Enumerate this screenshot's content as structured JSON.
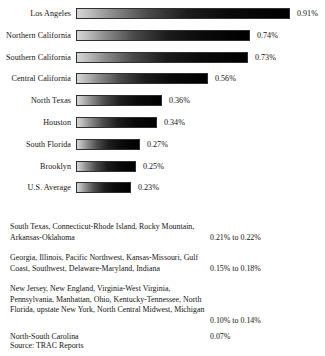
{
  "chart_data": {
    "type": "bar",
    "title": "",
    "xlabel": "",
    "ylabel": "",
    "orientation": "horizontal",
    "grid": false,
    "legend": null,
    "value_suffix": "%",
    "xlim": [
      0,
      0.91
    ],
    "categories": [
      "Los Angeles",
      "Northern California",
      "Southern California",
      "Central California",
      "North Texas",
      "Houston",
      "South Florida",
      "Brooklyn",
      "U.S. Average"
    ],
    "values": [
      0.91,
      0.74,
      0.73,
      0.56,
      0.36,
      0.34,
      0.27,
      0.25,
      0.23
    ],
    "value_labels": [
      "0.91%",
      "0.74%",
      "0.73%",
      "0.56%",
      "0.36%",
      "0.34%",
      "0.27%",
      "0.25%",
      "0.23%"
    ]
  },
  "bars": [
    {
      "label": "Los Angeles",
      "value_label": "0.91%",
      "width_px": 214
    },
    {
      "label": "Northern California",
      "value_label": "0.74%",
      "width_px": 174
    },
    {
      "label": "Southern California",
      "value_label": "0.73%",
      "width_px": 172
    },
    {
      "label": "Central California",
      "value_label": "0.56%",
      "width_px": 132
    },
    {
      "label": "North Texas",
      "value_label": "0.36%",
      "width_px": 86
    },
    {
      "label": "Houston",
      "value_label": "0.34%",
      "width_px": 81
    },
    {
      "label": "South Florida",
      "value_label": "0.27%",
      "width_px": 64
    },
    {
      "label": "Brooklyn",
      "value_label": "0.25%",
      "width_px": 60
    },
    {
      "label": "U.S. Average",
      "value_label": "0.23%",
      "width_px": 55
    }
  ],
  "notes": [
    {
      "names": "South Texas, Connecticut-Rhode Island, Rocky Mountain, Arkansas-Oklahoma",
      "value": "0.21% to 0.22%",
      "top": 17,
      "value_top": 28
    },
    {
      "names": "Georgia, Illinois, Pacific Northwest, Kansas-Missouri, Gulf Coast, Southwest, Delaware-Maryland, Indiana",
      "value": "0.15% to 0.18%",
      "top": 48,
      "value_top": 59
    },
    {
      "names": "New Jersey, New England, Virginia-West Virginia, Pennsylvania, Manhattan, Ohio, Kentucky-Tennessee, North Florida, upstate New York, North Central Midwest, Michigan",
      "value": "0.10% to 0.14%",
      "top": 79,
      "value_top": 111
    },
    {
      "names": "North-South Carolina",
      "value": "0.07%",
      "top": 127,
      "value_top": 127
    }
  ],
  "source": "Source: TRAC Reports"
}
